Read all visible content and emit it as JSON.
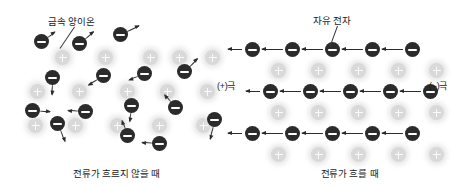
{
  "figure": {
    "background": "#ffffff",
    "ion_color": "#d9d9d9",
    "electron_color": "#2b2b2b"
  },
  "panels": {
    "left": {
      "caption": "전류가 흐르지 않을 때",
      "callout": "금속 양이온",
      "ions": [
        {
          "x": 55,
          "y": 50
        },
        {
          "x": 98,
          "y": 50
        },
        {
          "x": 143,
          "y": 50
        },
        {
          "x": 172,
          "y": 50
        },
        {
          "x": 205,
          "y": 50
        },
        {
          "x": 30,
          "y": 84
        },
        {
          "x": 72,
          "y": 84
        },
        {
          "x": 120,
          "y": 84
        },
        {
          "x": 160,
          "y": 84
        },
        {
          "x": 200,
          "y": 84
        },
        {
          "x": 28,
          "y": 118
        },
        {
          "x": 68,
          "y": 118
        },
        {
          "x": 110,
          "y": 118
        },
        {
          "x": 152,
          "y": 118
        },
        {
          "x": 196,
          "y": 118
        }
      ],
      "electrons": [
        {
          "x": 34,
          "y": 34,
          "angle": -35,
          "len": 16
        },
        {
          "x": 72,
          "y": 36,
          "angle": -40,
          "len": 18
        },
        {
          "x": 113,
          "y": 27,
          "angle": -25,
          "len": 20
        },
        {
          "x": 45,
          "y": 70,
          "angle": 95,
          "len": 17
        },
        {
          "x": 96,
          "y": 68,
          "angle": 150,
          "len": 18
        },
        {
          "x": 137,
          "y": 66,
          "angle": 160,
          "len": 17
        },
        {
          "x": 177,
          "y": 64,
          "angle": -45,
          "len": 18
        },
        {
          "x": 25,
          "y": 103,
          "angle": 5,
          "len": 17
        },
        {
          "x": 78,
          "y": 104,
          "angle": 185,
          "len": 18
        },
        {
          "x": 124,
          "y": 98,
          "angle": 100,
          "len": 16
        },
        {
          "x": 168,
          "y": 100,
          "angle": -130,
          "len": 17
        },
        {
          "x": 50,
          "y": 116,
          "angle": 70,
          "len": 19
        },
        {
          "x": 120,
          "y": 128,
          "angle": 250,
          "len": 16
        },
        {
          "x": 152,
          "y": 136,
          "angle": 185,
          "len": 18
        },
        {
          "x": 207,
          "y": 112,
          "angle": 105,
          "len": 20
        }
      ]
    },
    "right": {
      "caption": "전류가 흐를 때",
      "callout": "자유 전자",
      "pole_left": "(+)극",
      "pole_right": "(−)극",
      "electron_rows": [
        {
          "y": 42,
          "xs": [
            12,
            52,
            92,
            132,
            172
          ]
        },
        {
          "y": 84,
          "xs": [
            30,
            70,
            110,
            150,
            190
          ]
        },
        {
          "y": 126,
          "xs": [
            12,
            52,
            92,
            132,
            172
          ]
        }
      ],
      "ion_rows": [
        {
          "y": 63,
          "xs": [
            38,
            78,
            118,
            158,
            196
          ]
        },
        {
          "y": 105,
          "xs": [
            38,
            78,
            118,
            158,
            196
          ]
        },
        {
          "y": 147,
          "xs": [
            38,
            78,
            118,
            158,
            196
          ]
        }
      ]
    }
  }
}
